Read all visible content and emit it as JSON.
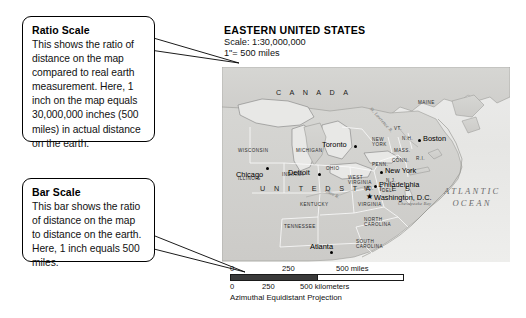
{
  "callouts": [
    {
      "id": "ratio-scale",
      "title": "Ratio Scale",
      "body": "This shows the ratio of distance on the map compared to real earth measurement. Here, 1 inch on the map equals 30,000,000 inches (500 miles) in actual distance on the earth."
    },
    {
      "id": "bar-scale",
      "title": "Bar Scale",
      "body": "This bar shows the ratio of distance on the map to distance on the earth. Here, 1 inch equals 500 miles."
    }
  ],
  "map": {
    "title": "EASTERN UNITED STATES",
    "scale_ratio": "Scale: 1:30,000,000",
    "scale_inch": "1\"= 500 miles",
    "projection": "Azimuthal Equidistant Projection",
    "countries": [
      "C A N A D A",
      "U N I T E D   S T A T E S"
    ],
    "ocean": "ATLANTIC OCEAN",
    "water_features": [
      "St. Lawrence R.",
      "Ohio R.",
      "Chesapeake Bay"
    ],
    "states": [
      "WISCONSIN",
      "MICHIGAN",
      "ILLINOIS",
      "INDIANA",
      "OHIO",
      "PENN.",
      "NEW YORK",
      "VT.",
      "N.H.",
      "MAINE",
      "MASS.",
      "R.I.",
      "CONN.",
      "N.J.",
      "DEL.",
      "MD.",
      "WEST VIRGINIA",
      "VIRGINIA",
      "KENTUCKY",
      "TENNESSEE",
      "NORTH CAROLINA",
      "SOUTH CAROLINA"
    ],
    "cities": [
      {
        "name": "Toronto",
        "type": "city"
      },
      {
        "name": "Detroit",
        "type": "city"
      },
      {
        "name": "Chicago",
        "type": "city"
      },
      {
        "name": "Boston",
        "type": "city"
      },
      {
        "name": "New York",
        "type": "city"
      },
      {
        "name": "Philadelphia",
        "type": "city"
      },
      {
        "name": "Washington, D.C.",
        "type": "capital"
      },
      {
        "name": "Atlanta",
        "type": "city"
      }
    ]
  },
  "scale_bars": {
    "miles": {
      "ticks": [
        "0",
        "250",
        "500 miles"
      ],
      "fill_percent": 50
    },
    "kilometers": {
      "ticks": [
        "0",
        "250",
        "500 kilometers"
      ],
      "fill_percent": 31
    }
  },
  "colors": {
    "land": "#d2d2cf",
    "ocean": "#ececea",
    "border": "#000000",
    "bar_fill": "#3a3a3a"
  }
}
